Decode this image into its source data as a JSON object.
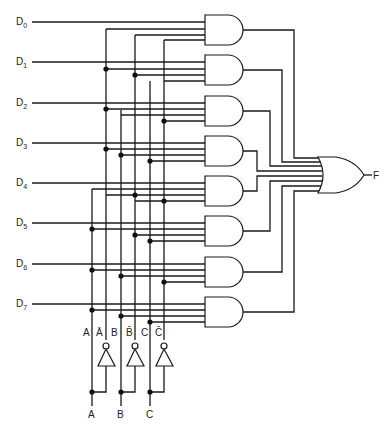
{
  "diagram": {
    "data_inputs": [
      {
        "label": "D",
        "sub": "0"
      },
      {
        "label": "D",
        "sub": "1"
      },
      {
        "label": "D",
        "sub": "2"
      },
      {
        "label": "D",
        "sub": "3"
      },
      {
        "label": "D",
        "sub": "4"
      },
      {
        "label": "D",
        "sub": "5"
      },
      {
        "label": "D",
        "sub": "6"
      },
      {
        "label": "D",
        "sub": "7"
      }
    ],
    "select_bus_labels": [
      "A",
      "Ā",
      "B",
      "B̄",
      "C",
      "C̄"
    ],
    "select_inputs": [
      "A",
      "B",
      "C"
    ],
    "output_label": "F",
    "gate_select_terms": [
      [
        "Ā",
        "B̄",
        "C̄"
      ],
      [
        "A",
        "B̄",
        "C̄"
      ],
      [
        "A",
        "B",
        "C̄"
      ],
      [
        "A",
        "B̄",
        "C"
      ],
      [
        "Ā",
        "B",
        "C"
      ],
      [
        "A",
        "B",
        "C"
      ],
      [
        "A",
        "B",
        "C"
      ],
      [
        "A",
        "B",
        "C"
      ]
    ],
    "colors": {
      "ink": "#1a1a1a",
      "background": "#ffffff"
    }
  }
}
